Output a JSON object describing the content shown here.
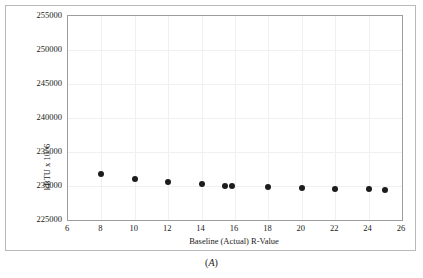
{
  "figure": {
    "caption_open": "(",
    "caption_letter": "A",
    "caption_close": ")",
    "caption": "(A)"
  },
  "chart_data": {
    "type": "scatter",
    "title": "",
    "xlabel": "Baseline (Actual) R-Value",
    "ylabel": "kBTU x 10^6",
    "ylabel_display": "kBTU x 10^6",
    "xlim": [
      6,
      26
    ],
    "ylim": [
      225000,
      255000
    ],
    "xticks": [
      6,
      8,
      10,
      12,
      14,
      16,
      18,
      20,
      22,
      24,
      26
    ],
    "xtick_labels": [
      "6",
      "8",
      "10",
      "12",
      "14",
      "16",
      "18",
      "20",
      "22",
      "24",
      "26"
    ],
    "yticks": [
      225000,
      230000,
      235000,
      240000,
      245000,
      250000,
      255000
    ],
    "ytick_labels": [
      "225000",
      "230000",
      "235000",
      "240000",
      "245000",
      "250000",
      "255000"
    ],
    "grid": true,
    "grid_color": "#f0f0f0",
    "legend": "none",
    "marker_color": "#1c1c1c",
    "marker_shape": "circle",
    "points": [
      {
        "x": 8,
        "y": 231750
      },
      {
        "x": 10,
        "y": 231050
      },
      {
        "x": 12,
        "y": 230550
      },
      {
        "x": 14,
        "y": 230250
      },
      {
        "x": 15.4,
        "y": 230050
      },
      {
        "x": 15.8,
        "y": 230030
      },
      {
        "x": 18,
        "y": 229900
      },
      {
        "x": 20,
        "y": 229760
      },
      {
        "x": 22,
        "y": 229620
      },
      {
        "x": 24,
        "y": 229520
      },
      {
        "x": 25,
        "y": 229470
      }
    ],
    "series": [
      {
        "name": "Energy use",
        "x": [
          8,
          10,
          12,
          14,
          15.4,
          15.8,
          18,
          20,
          22,
          24,
          25
        ],
        "values": [
          231750,
          231050,
          230550,
          230250,
          230050,
          230030,
          229900,
          229760,
          229620,
          229520,
          229470
        ]
      }
    ]
  }
}
